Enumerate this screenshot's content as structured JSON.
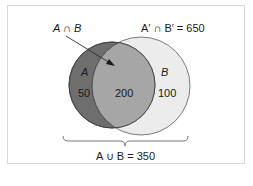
{
  "diagram": {
    "type": "venn",
    "labels": {
      "intersection": "A ∩ B",
      "complement_intersection": "A′ ∩ B′ = 650",
      "set_a": "A",
      "set_b": "B",
      "a_only": "50",
      "both": "200",
      "b_only": "100",
      "union": "A ∪ B = 350"
    },
    "colors": {
      "set_a_fill": "#6e6e6e",
      "intersection_fill": "#a6a6a6",
      "set_b_fill": "#ececec",
      "outline": "#3a3a3a",
      "frame_border": "#d6d6d6",
      "text": "#1a1a1a"
    }
  }
}
